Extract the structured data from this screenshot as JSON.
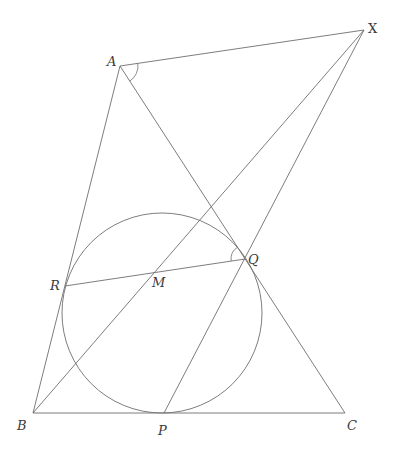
{
  "diagram": {
    "type": "geometry",
    "stroke_color": "#6e6e6e",
    "label_color": "#3a3a3a",
    "points": {
      "A": {
        "label": "A",
        "x": 120,
        "y": 66
      },
      "B": {
        "label": "B",
        "x": 33,
        "y": 413
      },
      "C": {
        "label": "C",
        "x": 345,
        "y": 413
      },
      "X": {
        "label": "X",
        "x": 364,
        "y": 30
      },
      "P": {
        "label": "P",
        "x": 164,
        "y": 413
      },
      "Q": {
        "label": "Q",
        "x": 245,
        "y": 259
      },
      "R": {
        "label": "R",
        "x": 65,
        "y": 286
      },
      "M": {
        "label": "M",
        "x": 155,
        "y": 272
      }
    },
    "incircle": {
      "cx": 162,
      "cy": 313,
      "r": 100
    },
    "segments": [
      [
        "A",
        "B"
      ],
      [
        "B",
        "C"
      ],
      [
        "C",
        "A"
      ],
      [
        "A",
        "X"
      ],
      [
        "X",
        "B"
      ],
      [
        "X",
        "P"
      ],
      [
        "R",
        "Q"
      ]
    ],
    "angle_marks": [
      {
        "vertex": "A",
        "between": [
          "X",
          "C"
        ]
      },
      {
        "vertex": "Q",
        "between": [
          "R",
          "A"
        ]
      }
    ]
  }
}
